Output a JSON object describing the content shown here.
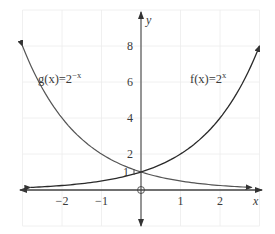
{
  "chart_data": {
    "type": "line",
    "title": "",
    "xlabel": "x",
    "ylabel": "y",
    "xlim": [
      -3,
      3
    ],
    "ylim": [
      -1.5,
      9.5
    ],
    "grid": true,
    "x_ticks": [
      -2,
      -1,
      1,
      2
    ],
    "x_tick_labels": [
      "−2",
      "−1",
      "1",
      "2"
    ],
    "y_ticks": [
      1,
      2,
      4,
      6,
      8
    ],
    "y_tick_labels": [
      "1",
      "2",
      "4",
      "6",
      "8"
    ],
    "series": [
      {
        "name": "f(x) = 2^x",
        "label_text": "f(x)=2",
        "label_exponent": "x",
        "x": [
          -2.8,
          -2,
          -1,
          0,
          1,
          2,
          3
        ],
        "y": [
          0.144,
          0.25,
          0.5,
          1,
          2,
          4,
          8
        ],
        "color": "#2a2a2a"
      },
      {
        "name": "g(x) = 2^-x",
        "label_text": "g(x)=2",
        "label_exponent": "−x",
        "x": [
          -3,
          -2,
          -1,
          0,
          1,
          2,
          2.8
        ],
        "y": [
          8,
          4,
          2,
          1,
          0.5,
          0.25,
          0.144
        ],
        "color": "#555555"
      }
    ],
    "annotations": [
      {
        "text": "Intersection at (0, 1)",
        "x": 0,
        "y": 1
      },
      {
        "text": "Open circle at origin",
        "x": 0,
        "y": 0
      }
    ]
  }
}
